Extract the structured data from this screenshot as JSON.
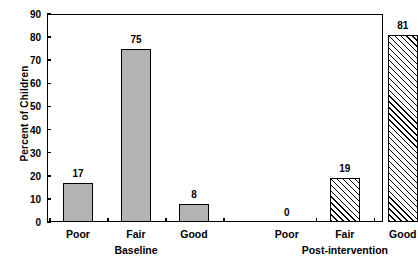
{
  "chart_data": {
    "type": "bar",
    "title": "",
    "xlabel": "",
    "ylabel": "Percent of Children",
    "ylim": [
      0,
      90
    ],
    "ytick_labels": [
      "0",
      "10",
      "20",
      "30",
      "40",
      "50",
      "60",
      "70",
      "80",
      "90"
    ],
    "ytick_values": [
      0,
      10,
      20,
      30,
      40,
      50,
      60,
      70,
      80,
      90
    ],
    "grid": false,
    "legend": "none",
    "categories": [
      "Poor",
      "Fair",
      "Good"
    ],
    "groups": [
      "Baseline",
      "Post-intervention"
    ],
    "series": [
      {
        "name": "Baseline",
        "values": [
          17,
          75,
          8
        ],
        "fill": "solid-gray",
        "color": "#b3b3b3"
      },
      {
        "name": "Post-intervention",
        "values": [
          0,
          19,
          81
        ],
        "fill": "diagonal-hatch",
        "color": "#ffffff"
      }
    ],
    "bars": [
      {
        "group": "Baseline",
        "category": "Poor",
        "value": 17,
        "label": "17",
        "fill": "solid-gray"
      },
      {
        "group": "Baseline",
        "category": "Fair",
        "value": 75,
        "label": "75",
        "fill": "solid-gray"
      },
      {
        "group": "Baseline",
        "category": "Good",
        "value": 8,
        "label": "8",
        "fill": "solid-gray"
      },
      {
        "group": "Post-intervention",
        "category": "Poor",
        "value": 0,
        "label": "0",
        "fill": "diagonal-hatch"
      },
      {
        "group": "Post-intervention",
        "category": "Fair",
        "value": 19,
        "label": "19",
        "fill": "diagonal-hatch"
      },
      {
        "group": "Post-intervention",
        "category": "Good",
        "value": 81,
        "label": "81",
        "fill": "diagonal-hatch"
      }
    ],
    "colors": {
      "axis": "#000000",
      "text": "#000000",
      "bar_solid": "#b3b3b3",
      "bar_hatch_line": "#000000",
      "background": "#ffffff"
    }
  }
}
